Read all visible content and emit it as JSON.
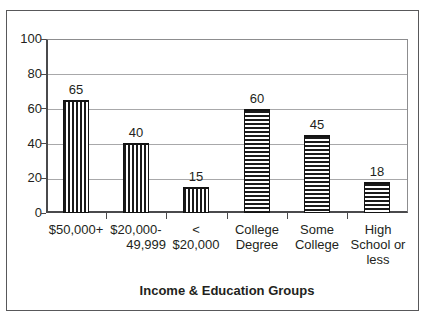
{
  "chart_data": {
    "type": "bar",
    "title": "",
    "subtitle": "",
    "xlabel": "Income & Education Groups",
    "ylabel": "",
    "ylim": [
      0,
      100
    ],
    "ytick_step": 20,
    "grid": true,
    "legend": "none",
    "categories": [
      "$50,000+",
      "$20,000-49,999",
      "< $20,000",
      "College Degree",
      "Some College",
      "High School or less"
    ],
    "values": [
      65,
      40,
      15,
      60,
      45,
      18
    ],
    "data_labels": [
      "65",
      "40",
      "15",
      "60",
      "45",
      "18"
    ],
    "bar_fills": [
      "vertical-hatch",
      "vertical-hatch",
      "vertical-hatch",
      "horizontal-hatch",
      "horizontal-hatch",
      "horizontal-hatch"
    ],
    "ticks": [
      "0",
      "20",
      "40",
      "60",
      "80",
      "100"
    ],
    "category_label_lines": [
      [
        "$50,000+",
        "",
        ""
      ],
      [
        "$20,000-",
        "49,999",
        ""
      ],
      [
        "<",
        "$20,000",
        ""
      ],
      [
        "College",
        "Degree",
        ""
      ],
      [
        "Some",
        "College",
        ""
      ],
      [
        "High",
        "School or",
        "less"
      ]
    ]
  },
  "colors": {
    "frame": "#58585a",
    "axis": "#4a4a4c",
    "gridline": "#a8a8aa",
    "bar_ink": "#1a1a1a",
    "text": "#231f20",
    "background": "#ffffff"
  }
}
